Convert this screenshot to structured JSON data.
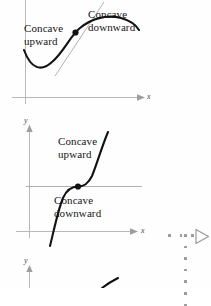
{
  "page": {
    "background_color": "#fefefe",
    "ink_color": "#161616",
    "axis_color": "#b3b3b3",
    "overlay_color": "#9a9a9a"
  },
  "figures": [
    {
      "id": "figure-concavity-sine",
      "axis_x_label": "x",
      "axis_y_label": "",
      "labels": [
        {
          "name": "concave-upward-label",
          "text": "Concave\nupward",
          "line1": "Concave",
          "line2": "upward"
        },
        {
          "name": "concave-downward-label",
          "text": "Concave\ndownward",
          "line1": "Concave",
          "line2": "downward"
        }
      ],
      "has_inflection_point": true,
      "has_tangent_line": true
    },
    {
      "id": "figure-concavity-cubic",
      "axis_x_label": "x",
      "axis_y_label": "y",
      "labels": [
        {
          "name": "concave-upward-label",
          "text": "Concave\nupward",
          "line1": "Concave",
          "line2": "upward"
        },
        {
          "name": "concave-downward-label",
          "text": "Concave\ndownward",
          "line1": "Concave",
          "line2": "downward"
        }
      ],
      "has_inflection_point": true,
      "has_tangent_line": true
    },
    {
      "id": "figure-partial-bottom",
      "axis_x_label": "",
      "axis_y_label": "y",
      "labels": [],
      "has_inflection_point": false,
      "has_tangent_line": false
    }
  ],
  "fig1": {
    "concave_upward_line1": "Concave",
    "concave_upward_line2": "upward",
    "concave_downward_line1": "Concave",
    "concave_downward_line2": "downward",
    "x_axis_label": "x"
  },
  "fig2": {
    "concave_upward_line1": "Concave",
    "concave_upward_line2": "upward",
    "concave_downward_line1": "Concave",
    "concave_downward_line2": "downward",
    "x_axis_label": "x",
    "y_axis_label": "y"
  },
  "fig3": {
    "y_axis_label": "y"
  },
  "overlay": {
    "expand_control_name": "expand-triangle-button",
    "dots_horizontal_count": 3,
    "dots_vertical_count": 7,
    "color": "#9a9a9a"
  }
}
